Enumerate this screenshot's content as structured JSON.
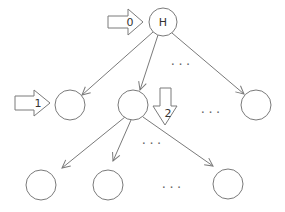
{
  "diagram": {
    "root": {
      "label": "H"
    },
    "arrows": [
      {
        "label": "0"
      },
      {
        "label": "1"
      },
      {
        "label": "2"
      }
    ],
    "ellipsis": "...",
    "colors": {
      "stroke": "#7a7a7a",
      "text": "#333333",
      "background": "#ffffff"
    }
  }
}
